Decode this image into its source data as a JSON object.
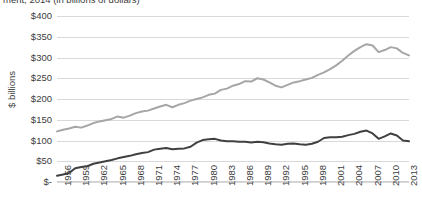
{
  "chart": {
    "title": "ment, 2014 (in billions of dollars)",
    "ylabel": "$ billions"
  },
  "chart_data": {
    "type": "line",
    "title": "ment, 2014 (in billions of dollars)",
    "xlabel": "",
    "ylabel": "$ billions",
    "ylim": [
      0,
      400
    ],
    "ytick_labels": [
      "$400",
      "$350",
      "$300",
      "$250",
      "$200",
      "$150",
      "$100",
      "$50",
      "$-"
    ],
    "ytick_values": [
      400,
      350,
      300,
      250,
      200,
      150,
      100,
      50,
      0
    ],
    "grid": true,
    "legend": "none",
    "xtick_labels": [
      "1956",
      "1959",
      "1962",
      "1965",
      "1968",
      "1971",
      "1974",
      "1977",
      "1980",
      "1983",
      "1986",
      "1989",
      "1992",
      "1995",
      "1998",
      "2001",
      "2004",
      "2007",
      "2010",
      "2013"
    ],
    "x": [
      1956,
      1957,
      1958,
      1959,
      1960,
      1961,
      1962,
      1963,
      1964,
      1965,
      1966,
      1967,
      1968,
      1969,
      1970,
      1971,
      1972,
      1973,
      1974,
      1975,
      1976,
      1977,
      1978,
      1979,
      1980,
      1981,
      1982,
      1983,
      1984,
      1985,
      1986,
      1987,
      1988,
      1989,
      1990,
      1991,
      1992,
      1993,
      1994,
      1995,
      1996,
      1997,
      1998,
      1999,
      2000,
      2001,
      2002,
      2003,
      2004,
      2005,
      2006,
      2007,
      2008,
      2009,
      2010,
      2011,
      2012,
      2013,
      2014
    ],
    "series": [
      {
        "name": "upper-series",
        "color": "#a6a6a6",
        "values": [
          122,
          126,
          129,
          133,
          131,
          136,
          142,
          146,
          149,
          152,
          158,
          155,
          160,
          166,
          170,
          172,
          177,
          182,
          186,
          180,
          186,
          190,
          196,
          200,
          204,
          210,
          213,
          222,
          225,
          232,
          236,
          243,
          242,
          250,
          247,
          240,
          232,
          228,
          234,
          240,
          243,
          247,
          251,
          258,
          264,
          272,
          281,
          292,
          305,
          316,
          325,
          332,
          329,
          313,
          318,
          325,
          322,
          311,
          305
        ]
      },
      {
        "name": "lower-series",
        "color": "#404040",
        "values": [
          15,
          18,
          22,
          33,
          36,
          38,
          44,
          47,
          50,
          53,
          57,
          60,
          63,
          67,
          70,
          72,
          78,
          80,
          82,
          79,
          80,
          81,
          85,
          95,
          101,
          103,
          104,
          100,
          98,
          98,
          97,
          97,
          95,
          97,
          96,
          93,
          91,
          90,
          92,
          93,
          91,
          90,
          92,
          97,
          106,
          108,
          108,
          109,
          113,
          116,
          121,
          124,
          117,
          104,
          110,
          117,
          112,
          100,
          98
        ]
      }
    ]
  }
}
